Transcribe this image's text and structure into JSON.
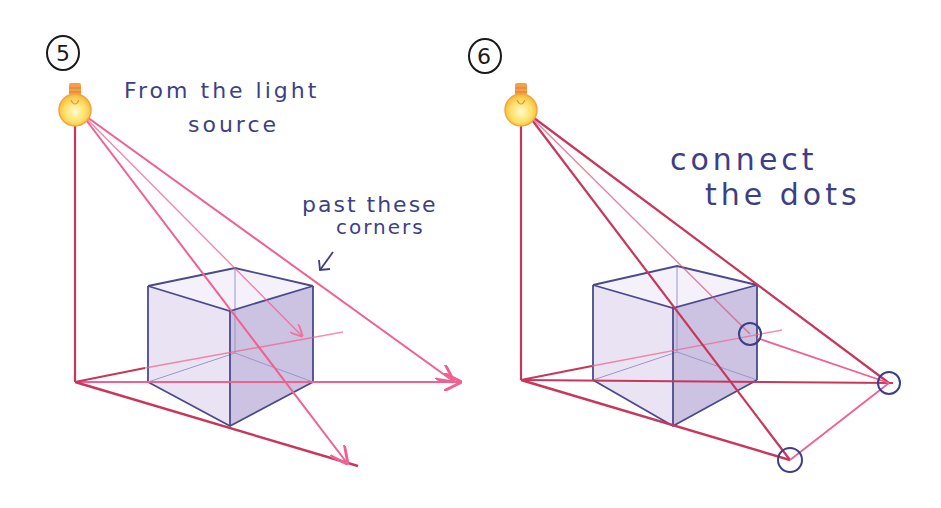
{
  "colors": {
    "ray_pink": "#f06090",
    "ray_dark": "#c8365c",
    "cube_edge": "#4a4a8c",
    "cube_face_left": "#e8e2f2",
    "cube_face_right": "#c9bfe0",
    "cube_face_top": "#f4f1fa",
    "handwriting": "#3d3f86",
    "bulb_glow": "#ffd84a",
    "bulb_base": "#f4a04a"
  },
  "panels": [
    {
      "step": "5",
      "notes": [
        {
          "line1": "From the light",
          "line2": "source"
        },
        {
          "line1": "past these",
          "line2": "corners"
        }
      ]
    },
    {
      "step": "6",
      "notes": [
        {
          "line1": "connect",
          "line2": "the dots"
        }
      ]
    }
  ]
}
